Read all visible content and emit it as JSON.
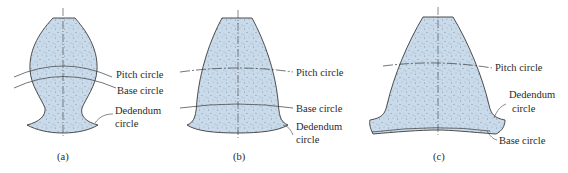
{
  "figure": {
    "colors": {
      "tooth_fill": "#c9daea",
      "outline": "#3a3a3a",
      "stipple": "#6f8293",
      "text": "#2a2a2a"
    },
    "panels": [
      {
        "id": "a",
        "caption": "(a)",
        "labels": {
          "pitch": "Pitch circle",
          "base": "Base circle",
          "dedendum_line1": "Dedendum",
          "dedendum_line2": "circle"
        }
      },
      {
        "id": "b",
        "caption": "(b)",
        "labels": {
          "pitch": "Pitch circle",
          "base": "Base circle",
          "dedendum_line1": "Dedendum",
          "dedendum_line2": "circle"
        }
      },
      {
        "id": "c",
        "caption": "(c)",
        "labels": {
          "pitch": "Pitch circle",
          "dedendum_line1": "Dedendum",
          "dedendum_line2": "circle",
          "base": "Base circle"
        }
      }
    ]
  }
}
